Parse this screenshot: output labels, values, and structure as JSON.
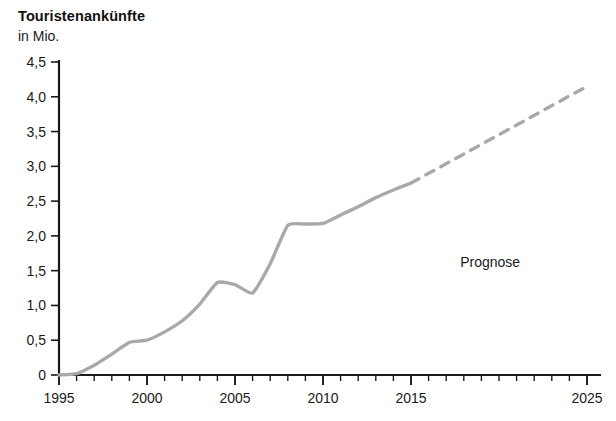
{
  "header": {
    "title": "Touristenankünfte",
    "subtitle": "in Mio."
  },
  "annotations": {
    "forecast_label": "Prognose"
  },
  "axis": {
    "y_ticks": [
      "0",
      "0,5",
      "1,0",
      "1,5",
      "2,0",
      "2,5",
      "3,0",
      "3,5",
      "4,0",
      "4,5"
    ],
    "x_ticks": [
      "1995",
      "2000",
      "2005",
      "2010",
      "2015",
      "2025"
    ]
  },
  "style": {
    "line_color": "#a9a9a9",
    "axis_color": "#1a1a1a",
    "text_color": "#1a1a1a"
  },
  "chart_data": {
    "type": "line",
    "title": "Touristenankünfte",
    "subtitle": "in Mio.",
    "xlabel": "",
    "ylabel": "in Mio.",
    "xlim": [
      1995,
      2025
    ],
    "ylim": [
      0,
      4.5
    ],
    "grid": false,
    "legend": "none",
    "y_tick_values": [
      0,
      0.5,
      1.0,
      1.5,
      2.0,
      2.5,
      3.0,
      3.5,
      4.0,
      4.5
    ],
    "y_tick_labels": [
      "0",
      "0,5",
      "1,0",
      "1,5",
      "2,0",
      "2,5",
      "3,0",
      "3,5",
      "4,0",
      "4,5"
    ],
    "x_tick_values": [
      1995,
      2000,
      2005,
      2010,
      2015,
      2025
    ],
    "x_tick_labels": [
      "1995",
      "2000",
      "2005",
      "2010",
      "2015",
      "2025"
    ],
    "x_minor_tick_step": 1,
    "annotations": [
      {
        "text": "Prognose",
        "x": 2019.5,
        "y": 1.55
      }
    ],
    "series": [
      {
        "name": "Touristenankünfte (Ist)",
        "style": "solid",
        "color": "#a9a9a9",
        "x": [
          1995,
          1996,
          1997,
          1998,
          1999,
          2000,
          2001,
          2002,
          2003,
          2004,
          2005,
          2006,
          2007,
          2008,
          2009,
          2010,
          2011,
          2012,
          2013,
          2014,
          2015
        ],
        "values": [
          0.0,
          0.02,
          0.14,
          0.3,
          0.47,
          0.5,
          0.62,
          0.78,
          1.02,
          1.33,
          1.3,
          1.18,
          1.6,
          2.15,
          2.17,
          2.18,
          2.3,
          2.42,
          2.55,
          2.66,
          2.76
        ]
      },
      {
        "name": "Prognose",
        "style": "dashed",
        "color": "#a9a9a9",
        "x": [
          2015,
          2025
        ],
        "values": [
          2.76,
          4.15
        ]
      }
    ]
  }
}
